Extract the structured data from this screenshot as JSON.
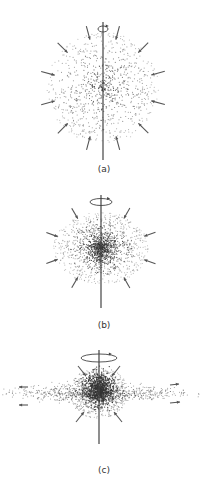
{
  "figure": {
    "panels": [
      {
        "id": "a",
        "label": "(a)",
        "description": "Large spherical rotating cloud with inward-pointing arrows",
        "center": [
          104,
          90
        ],
        "radius": 56,
        "rotation_arrow_rx": 6,
        "axis": [
          22,
          160
        ],
        "arrows": 12
      },
      {
        "id": "b",
        "label": "(b)",
        "description": "Smaller, flattening cloud with denser core and faster rotation",
        "center": [
          104,
          252
        ],
        "radius_x": 47,
        "radius_y": 38,
        "rotation_arrow_rx": 11,
        "axis": [
          195,
          308
        ],
        "arrows": 8
      },
      {
        "id": "c",
        "label": "(c)",
        "description": "Dense central core surrounded by flattened disk, with outflow arrows along the disk",
        "center": [
          100,
          395
        ],
        "disk_half_width": 98,
        "rotation_arrow_rx": 18,
        "axis": [
          350,
          444
        ],
        "arrows": 8
      }
    ],
    "colors": {
      "dots": "#333333",
      "arrows": "#555555",
      "axis": "#444444",
      "background": "#ffffff"
    }
  }
}
